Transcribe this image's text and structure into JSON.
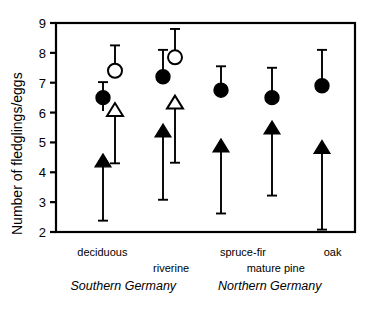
{
  "chart_data": {
    "type": "scatter",
    "title": "",
    "xlabel": "",
    "ylabel": "Number of fledglings/eggs",
    "ylim": [
      2,
      9
    ],
    "yticks": [
      2,
      3,
      4,
      5,
      6,
      7,
      8,
      9
    ],
    "ytick_labels": [
      "2",
      "3",
      "4",
      "5",
      "6",
      "7",
      "8",
      "9"
    ],
    "grid": false,
    "legend": "none",
    "categories": [
      "deciduous",
      "riverine",
      "spruce-fir",
      "mature pine",
      "oak"
    ],
    "group_labels": [
      {
        "text": "deciduous",
        "x_frac": 0.155,
        "row": 0
      },
      {
        "text": "riverine",
        "x_frac": 0.385,
        "row": 1
      },
      {
        "text": "spruce-fir",
        "x_frac": 0.625,
        "row": 0
      },
      {
        "text": "mature pine",
        "x_frac": 0.735,
        "row": 1
      },
      {
        "text": "oak",
        "x_frac": 0.925,
        "row": 0
      }
    ],
    "region_labels": [
      {
        "text": "Southern Germany",
        "x_frac": 0.225
      },
      {
        "text": "Northern Germany",
        "x_frac": 0.715
      }
    ],
    "series": [
      {
        "name": "filled-circle",
        "marker": "filled-circle",
        "points": [
          {
            "category": "deciduous",
            "x_px": 103,
            "value": 6.5,
            "err_low": 6.05,
            "err_high": 7.02
          },
          {
            "category": "riverine",
            "x_px": 163,
            "value": 7.2,
            "err_low": 7.2,
            "err_high": 8.1
          },
          {
            "category": "spruce-fir",
            "x_px": 221,
            "value": 6.75,
            "err_low": 6.75,
            "err_high": 7.55
          },
          {
            "category": "mature pine",
            "x_px": 272,
            "value": 6.5,
            "err_low": 6.5,
            "err_high": 7.5
          },
          {
            "category": "oak",
            "x_px": 322,
            "value": 6.9,
            "err_low": 6.9,
            "err_high": 8.1
          }
        ]
      },
      {
        "name": "open-circle",
        "marker": "open-circle",
        "points": [
          {
            "category": "deciduous",
            "x_px": 115,
            "value": 7.4,
            "err_low": 7.4,
            "err_high": 8.25
          },
          {
            "category": "riverine",
            "x_px": 175,
            "value": 7.85,
            "err_low": 7.85,
            "err_high": 8.8
          }
        ]
      },
      {
        "name": "filled-triangle",
        "marker": "filled-triangle-up",
        "points": [
          {
            "category": "deciduous",
            "x_px": 103,
            "value": 4.4,
            "err_low": 2.38,
            "err_high": 4.4
          },
          {
            "category": "riverine",
            "x_px": 163,
            "value": 5.4,
            "err_low": 3.08,
            "err_high": 5.4
          },
          {
            "category": "spruce-fir",
            "x_px": 221,
            "value": 4.9,
            "err_low": 2.62,
            "err_high": 4.9
          },
          {
            "category": "mature pine",
            "x_px": 272,
            "value": 5.5,
            "err_low": 3.22,
            "err_high": 5.5
          },
          {
            "category": "oak",
            "x_px": 322,
            "value": 4.85,
            "err_low": 2.08,
            "err_high": 4.85
          }
        ]
      },
      {
        "name": "open-triangle",
        "marker": "open-triangle-up",
        "points": [
          {
            "category": "deciduous",
            "x_px": 115,
            "value": 6.1,
            "err_low": 4.3,
            "err_high": 6.1
          },
          {
            "category": "riverine",
            "x_px": 175,
            "value": 6.35,
            "err_low": 4.32,
            "err_high": 6.35
          }
        ]
      }
    ],
    "colors": {
      "axis": "#000000",
      "marker_fill": "#000000",
      "marker_open_fill": "#ffffff",
      "error_bar": "#000000",
      "background": "#ffffff"
    }
  }
}
